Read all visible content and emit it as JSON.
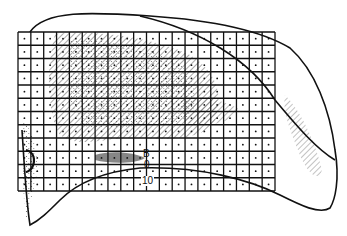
{
  "figure": {
    "type": "grid-overlay-specimen-drawing",
    "grid": {
      "columns": 20,
      "rows": 12,
      "left": 18,
      "top": 32,
      "cell_width": 12.85,
      "cell_height": 13.25,
      "center_dots": true
    },
    "labels": {
      "point_b": "B",
      "point_zero": "0",
      "scale_value": "10"
    },
    "colors": {
      "ink": "#111111",
      "background": "#ffffff",
      "hatch": "#555555"
    }
  }
}
